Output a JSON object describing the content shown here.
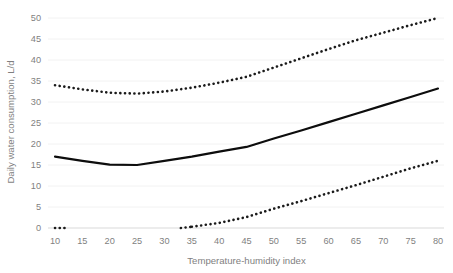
{
  "chart_data": {
    "type": "line",
    "title": "",
    "xlabel": "Temperature-humidity index",
    "ylabel": "Daily water consumption, L/d",
    "xlim": [
      7.5,
      82.5
    ],
    "ylim": [
      0,
      52
    ],
    "xticks": [
      10,
      15,
      20,
      25,
      30,
      35,
      40,
      45,
      50,
      55,
      60,
      65,
      70,
      75,
      80
    ],
    "yticks": [
      0,
      5,
      10,
      15,
      20,
      25,
      30,
      35,
      40,
      45,
      50
    ],
    "grid": "horizontal",
    "legend": "none",
    "x": [
      10,
      15,
      20,
      25,
      30,
      35,
      40,
      45,
      50,
      55,
      60,
      65,
      70,
      75,
      80
    ],
    "series": [
      {
        "name": "upper-bound",
        "style": "dotted",
        "color": "#1a1a1a",
        "values": [
          34.0,
          33.0,
          32.2,
          32.0,
          32.5,
          33.4,
          34.6,
          36.0,
          38.2,
          40.4,
          42.6,
          44.7,
          46.5,
          48.3,
          50.0
        ]
      },
      {
        "name": "mean",
        "style": "solid",
        "color": "#0d0d0d",
        "values": [
          17.0,
          16.0,
          15.1,
          15.0,
          16.0,
          17.0,
          18.2,
          19.3,
          21.3,
          23.2,
          25.2,
          27.2,
          29.2,
          31.2,
          33.2
        ]
      },
      {
        "name": "lower-bound",
        "style": "dotted",
        "color": "#1a1a1a",
        "values": [
          null,
          null,
          null,
          null,
          null,
          0.3,
          1.2,
          2.6,
          4.6,
          6.4,
          8.3,
          10.2,
          12.2,
          14.2,
          16.0
        ]
      }
    ],
    "extra_segments": [
      {
        "name": "lower-bound-stub",
        "style": "dotted",
        "color": "#1a1a1a",
        "x": [
          10,
          11.8
        ],
        "values": [
          0,
          0
        ]
      },
      {
        "name": "lower-bound-onset",
        "style": "dotted",
        "color": "#1a1a1a",
        "x": [
          33.0,
          35
        ],
        "values": [
          0,
          0.3
        ]
      }
    ],
    "axis_tick_labels_x": [
      "10",
      "15",
      "20",
      "25",
      "30",
      "35",
      "40",
      "45",
      "50",
      "55",
      "60",
      "65",
      "70",
      "75",
      "80"
    ],
    "axis_tick_labels_y": [
      "0",
      "5",
      "10",
      "15",
      "20",
      "25",
      "30",
      "35",
      "40",
      "45",
      "50"
    ],
    "colors": {
      "grid": "#f2f2f2",
      "axis": "#d9d9d9",
      "text": "#7f7f7f",
      "line": "#0d0d0d",
      "background": "#ffffff"
    }
  },
  "caption": {
    "cut_off_text": ""
  }
}
